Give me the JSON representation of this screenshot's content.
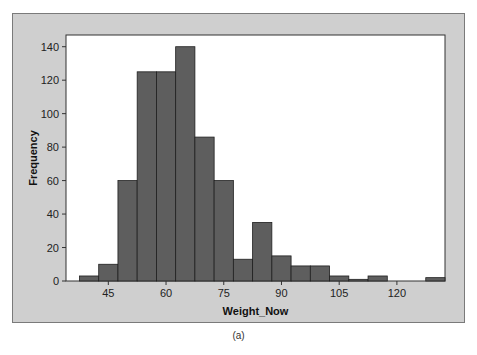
{
  "caption": "(a)",
  "chart_data": {
    "type": "bar",
    "subtype": "histogram",
    "title": "",
    "xlabel": "Weight_Now",
    "ylabel": "Frequency",
    "bin_width": 5,
    "bin_edges": [
      37.5,
      42.5,
      47.5,
      52.5,
      57.5,
      62.5,
      67.5,
      72.5,
      77.5,
      82.5,
      87.5,
      92.5,
      97.5,
      102.5,
      107.5,
      112.5,
      117.5,
      122.5,
      127.5,
      132.5
    ],
    "values": [
      3,
      10,
      60,
      125,
      125,
      140,
      86,
      60,
      13,
      35,
      15,
      9,
      9,
      3,
      1,
      3,
      0,
      0,
      2
    ],
    "xticks": [
      45,
      60,
      75,
      90,
      105,
      120
    ],
    "yticks": [
      0,
      20,
      40,
      60,
      80,
      100,
      120,
      140
    ],
    "xlim": [
      34,
      132.5
    ],
    "ylim": [
      0,
      147
    ],
    "grid": false,
    "legend": null,
    "colors": {
      "bar": "#5e5e5e",
      "bar_edge": "#1f1f1f",
      "frame_bg": "#cfcfcf",
      "plot_bg": "#ffffff"
    }
  }
}
